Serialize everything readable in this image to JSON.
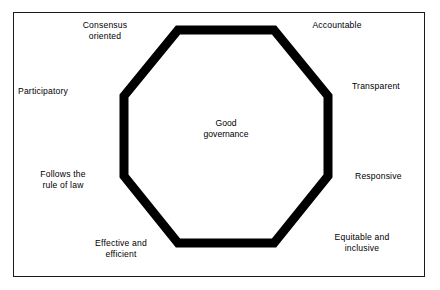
{
  "figure": {
    "type": "octagon-concept-diagram",
    "center": {
      "text": "Good\ngovernance"
    },
    "shape": {
      "name": "octagon",
      "stroke_color": "#000000",
      "fill_color": "#ffffff",
      "stroke_width_px": 5
    },
    "frame": {
      "border_color": "#1a1a1a",
      "background": "#ffffff"
    },
    "labels": [
      {
        "id": "consensus-oriented",
        "text": "Consensus\noriented",
        "position": "top-left"
      },
      {
        "id": "accountable",
        "text": "Accountable",
        "position": "top-right"
      },
      {
        "id": "transparent",
        "text": "Transparent",
        "position": "right-upper"
      },
      {
        "id": "responsive",
        "text": "Responsive",
        "position": "right-lower"
      },
      {
        "id": "equitable-inclusive",
        "text": "Equitable and\ninclusive",
        "position": "bottom-right"
      },
      {
        "id": "effective-efficient",
        "text": "Effective and\nefficient",
        "position": "bottom-left"
      },
      {
        "id": "follows-rule-of-law",
        "text": "Follows the\nrule of law",
        "position": "left-lower"
      },
      {
        "id": "participatory",
        "text": "Participatory",
        "position": "left-upper"
      }
    ]
  }
}
